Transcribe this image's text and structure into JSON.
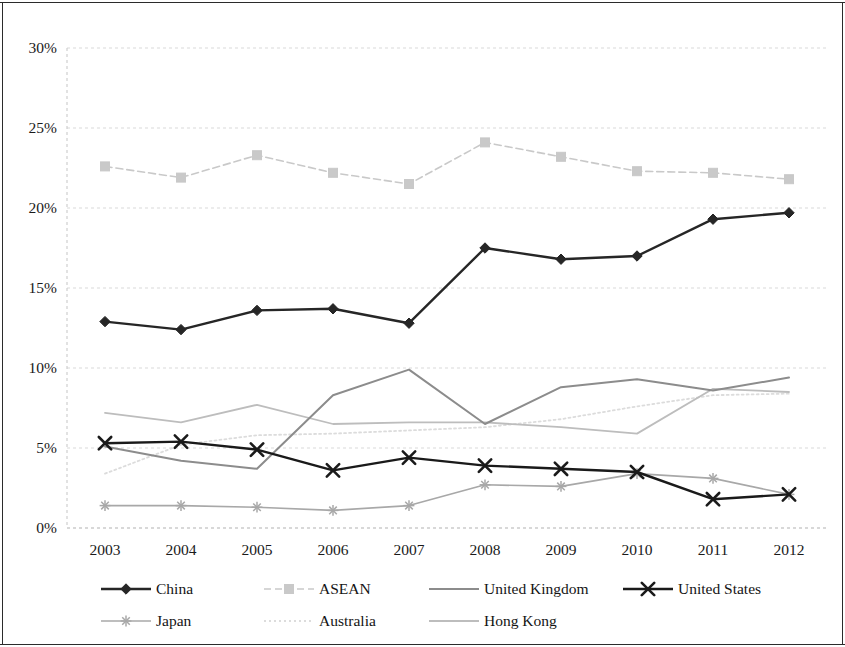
{
  "chart_data": {
    "type": "line",
    "title": "",
    "xlabel": "",
    "ylabel": "",
    "categories": [
      "2003",
      "2004",
      "2005",
      "2006",
      "2007",
      "2008",
      "2009",
      "2010",
      "2011",
      "2012"
    ],
    "x": [
      2003,
      2004,
      2005,
      2006,
      2007,
      2008,
      2009,
      2010,
      2011,
      2012
    ],
    "ylim": [
      0,
      30
    ],
    "ytick_values": [
      0,
      5,
      10,
      15,
      20,
      25,
      30
    ],
    "ytick_labels": [
      "0%",
      "5%",
      "10%",
      "15%",
      "20%",
      "25%",
      "30%"
    ],
    "grid": true,
    "grid_axis": "y",
    "legend_position": "bottom",
    "series": [
      {
        "name": "China",
        "color": "#262626",
        "marker": "diamond",
        "line_style": "solid",
        "line_width": 2.4,
        "values": [
          12.9,
          12.4,
          13.6,
          13.7,
          12.8,
          17.5,
          16.8,
          17.0,
          19.3,
          19.7
        ]
      },
      {
        "name": "ASEAN",
        "color": "#c9c9c9",
        "marker": "square",
        "line_style": "dashed",
        "line_width": 1.6,
        "values": [
          22.6,
          21.9,
          23.3,
          22.2,
          21.5,
          24.1,
          23.2,
          22.3,
          22.2,
          21.8
        ]
      },
      {
        "name": "United Kingdom",
        "color": "#8c8c8c",
        "marker": "none",
        "line_style": "solid",
        "line_width": 2.0,
        "values": [
          5.1,
          4.2,
          3.7,
          8.3,
          9.9,
          6.5,
          8.8,
          9.3,
          8.6,
          9.4
        ]
      },
      {
        "name": "United States",
        "color": "#1a1a1a",
        "marker": "x",
        "line_style": "solid",
        "line_width": 2.4,
        "values": [
          5.3,
          5.4,
          4.9,
          3.6,
          4.4,
          3.9,
          3.7,
          3.5,
          1.8,
          2.1
        ]
      },
      {
        "name": "Japan",
        "color": "#a8a8a8",
        "marker": "asterisk",
        "line_style": "solid",
        "line_width": 1.6,
        "values": [
          1.4,
          1.4,
          1.3,
          1.1,
          1.4,
          2.7,
          2.6,
          3.4,
          3.1,
          2.1
        ]
      },
      {
        "name": "Australia",
        "color": "#dcdcdc",
        "marker": "none",
        "line_style": "dotted",
        "line_width": 1.8,
        "values": [
          3.4,
          5.2,
          5.8,
          5.9,
          6.1,
          6.3,
          6.8,
          7.6,
          8.3,
          8.4
        ]
      },
      {
        "name": "Hong Kong",
        "color": "#bdbdbd",
        "marker": "none",
        "line_style": "solid",
        "line_width": 1.8,
        "values": [
          7.2,
          6.6,
          7.7,
          6.5,
          6.6,
          6.6,
          6.3,
          5.9,
          8.7,
          8.5
        ]
      }
    ]
  },
  "legend": {
    "items": [
      {
        "label": "China"
      },
      {
        "label": "ASEAN"
      },
      {
        "label": "United Kingdom"
      },
      {
        "label": "United States"
      },
      {
        "label": "Japan"
      },
      {
        "label": "Australia"
      },
      {
        "label": "Hong Kong"
      }
    ]
  }
}
